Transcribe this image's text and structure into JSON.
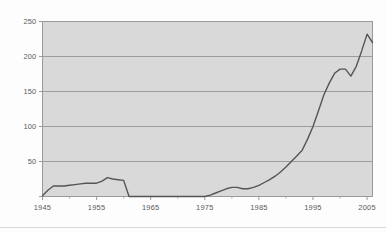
{
  "figure": {
    "background_color": "#fdfdfd",
    "plot_background_color": "#d9d9d9",
    "frame_color": "#9a9a9a",
    "grid_color": "#8e8e8e",
    "line_color": "#555555",
    "tick_text_color": "#5b5b5b"
  },
  "chart_data": {
    "type": "line",
    "title": "",
    "subtitle": "",
    "xlabel": "",
    "ylabel": "",
    "xlim": [
      1945,
      2006
    ],
    "ylim": [
      0,
      250
    ],
    "grid": true,
    "grid_axis": "y",
    "legend": false,
    "legend_position": "none",
    "yticks": [
      0,
      50,
      100,
      150,
      200,
      250
    ],
    "ytick_labels": [
      "",
      "50",
      "100",
      "150",
      "200",
      "250"
    ],
    "xticks": [
      1945,
      1955,
      1965,
      1975,
      1985,
      1995,
      2005
    ],
    "xtick_labels": [
      "1945",
      "1955",
      "1965",
      "1975",
      "1985",
      "1995",
      "2005"
    ],
    "xtick_minor": [
      1950,
      1960,
      1970,
      1980,
      1990,
      2000
    ],
    "series": [
      {
        "name": "value",
        "color": "#555555",
        "x": [
          1945,
          1946,
          1947,
          1948,
          1949,
          1950,
          1951,
          1952,
          1953,
          1954,
          1955,
          1956,
          1957,
          1958,
          1959,
          1960,
          1961,
          1962,
          1963,
          1964,
          1965,
          1966,
          1967,
          1968,
          1969,
          1970,
          1971,
          1972,
          1973,
          1974,
          1975,
          1976,
          1977,
          1978,
          1979,
          1980,
          1981,
          1982,
          1983,
          1984,
          1985,
          1986,
          1987,
          1988,
          1989,
          1990,
          1991,
          1992,
          1993,
          1994,
          1995,
          1996,
          1997,
          1998,
          1999,
          2000,
          2001,
          2002,
          2003,
          2004,
          2005,
          2006
        ],
        "values": [
          1,
          9,
          15,
          15,
          15,
          16,
          17,
          18,
          19,
          19,
          19,
          22,
          27,
          25,
          24,
          23,
          0,
          0,
          0,
          0,
          0,
          0,
          0,
          0,
          0,
          0,
          0,
          0,
          0,
          0,
          0,
          2,
          5,
          8,
          11,
          13,
          13,
          11,
          11,
          13,
          16,
          20,
          24,
          29,
          35,
          42,
          50,
          58,
          66,
          82,
          100,
          122,
          145,
          162,
          176,
          182,
          182,
          172,
          186,
          208,
          232,
          220
        ]
      }
    ]
  }
}
